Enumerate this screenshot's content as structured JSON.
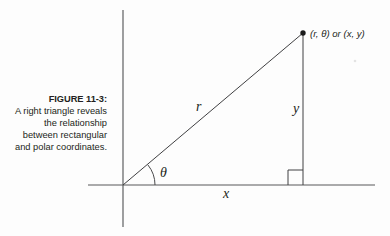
{
  "figure": {
    "caption_label": "FIGURE 11-3:",
    "caption_text": "A right triangle reveals the relationship between rectangular and polar coordinates.",
    "background_color": "#fdfdfd",
    "axis_color": "#58595b",
    "line_color": "#404042",
    "text_color": "#231f20"
  },
  "diagram": {
    "type": "right-triangle-polar-coordinates",
    "point_label": "(r, θ) or (x, y)",
    "hypotenuse_label": "r",
    "vertical_leg_label": "y",
    "horizontal_leg_label": "x",
    "angle_label": "θ",
    "right_angle_marker": "right-angle",
    "origin": {
      "x": 123,
      "y": 185
    },
    "point": {
      "x": 303,
      "y": 33
    },
    "foot": {
      "x": 303,
      "y": 185
    },
    "x_axis": {
      "x1": 88,
      "x2": 375,
      "y": 185
    },
    "y_axis": {
      "x": 123,
      "y1": 10,
      "y2": 227
    },
    "arc_radius": 32,
    "labels": {
      "r_position": {
        "x": 196,
        "y": 111
      },
      "y_position": {
        "x": 293,
        "y": 113
      },
      "x_position": {
        "x": 223,
        "y": 198
      },
      "theta_position": {
        "x": 160,
        "y": 177
      },
      "point_position": {
        "x": 310,
        "y": 37
      }
    }
  }
}
